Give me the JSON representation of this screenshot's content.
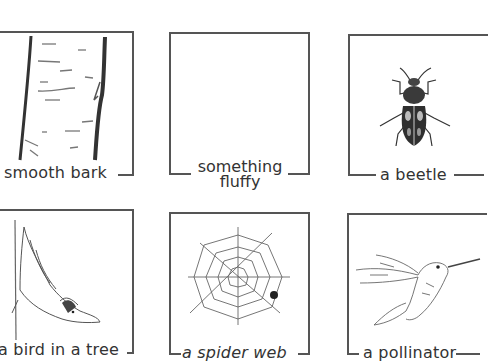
{
  "worksheet": {
    "cards": [
      {
        "id": "smooth-bark",
        "label": "smooth bark",
        "illustration": "tree-trunk-bark-icon"
      },
      {
        "id": "something-fluffy",
        "label_line1": "something",
        "label_line2": "fluffy",
        "illustration": "empty"
      },
      {
        "id": "a-beetle",
        "label": "a beetle",
        "illustration": "beetle-icon"
      },
      {
        "id": "a-bird-in-a-tree",
        "label": "a bird in a tree",
        "illustration": "nuthatch-bird-icon"
      },
      {
        "id": "a-spider-web",
        "label": "a spider web",
        "illustration": "spider-web-icon"
      },
      {
        "id": "a-pollinator",
        "label": "a pollinator",
        "illustration": "hummingbird-icon"
      }
    ]
  }
}
